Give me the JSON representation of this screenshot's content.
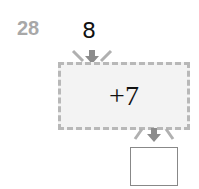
{
  "problem": {
    "number": "28",
    "input": "8",
    "operation": "+7",
    "answer": ""
  },
  "colors": {
    "number": "#a8a8a8",
    "box_fill": "#f3f3f3",
    "box_border": "#b8b8b8",
    "arrow": "#8c8c8c"
  }
}
